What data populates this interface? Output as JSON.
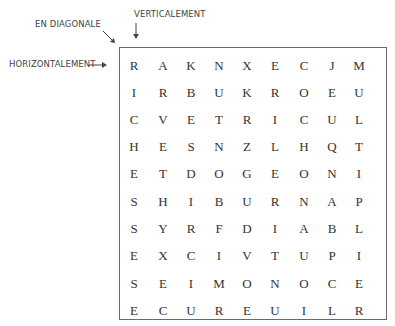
{
  "labels": {
    "diagonal": "EN DIAGONALE",
    "vertical": "VERTICALEMENT",
    "horizontal": "HORIZONTALEMENT"
  },
  "grid": {
    "rows": [
      [
        "R",
        "A",
        "K",
        "N",
        "X",
        "E",
        "C",
        "J",
        "M"
      ],
      [
        "I",
        "R",
        "B",
        "U",
        "K",
        "R",
        "O",
        "E",
        "U"
      ],
      [
        "C",
        "V",
        "E",
        "T",
        "R",
        "I",
        "C",
        "U",
        "L"
      ],
      [
        "H",
        "E",
        "S",
        "N",
        "Z",
        "L",
        "H",
        "Q",
        "T"
      ],
      [
        "E",
        "T",
        "D",
        "O",
        "G",
        "E",
        "O",
        "N",
        "I"
      ],
      [
        "S",
        "H",
        "I",
        "B",
        "U",
        "R",
        "N",
        "A",
        "P"
      ],
      [
        "S",
        "Y",
        "R",
        "F",
        "D",
        "I",
        "A",
        "B",
        "L"
      ],
      [
        "E",
        "X",
        "C",
        "I",
        "V",
        "T",
        "U",
        "P",
        "I"
      ],
      [
        "S",
        "E",
        "I",
        "M",
        "O",
        "N",
        "O",
        "C",
        "E"
      ],
      [
        "E",
        "C",
        "U",
        "R",
        "E",
        "U",
        "I",
        "L",
        "R"
      ]
    ]
  },
  "colors": {
    "text": "#333333",
    "border": "#6a6a6a",
    "label": "#444444"
  }
}
